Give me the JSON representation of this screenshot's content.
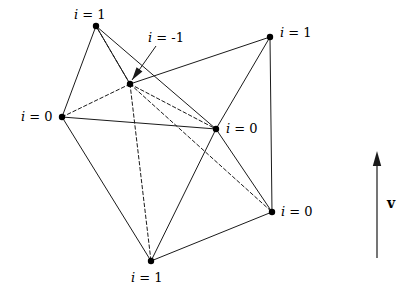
{
  "figure": {
    "type": "diagram",
    "background_color": "#ffffff",
    "stroke_color": "#1a1a1a",
    "vertex_color": "#000000",
    "vertex_radius": 3.2,
    "solid_stroke_width": 1.0,
    "dashed_stroke_width": 1.0,
    "dash_pattern": "3.5,2.5",
    "vertices": [
      {
        "id": "tl",
        "name": "top-left-vertex",
        "x": 96,
        "y": 26,
        "label": "i = 1",
        "label_x": 74,
        "label_y": 8,
        "label_align": "left"
      },
      {
        "id": "tr",
        "name": "top-right-vertex",
        "x": 270,
        "y": 37,
        "label": "i = 1",
        "label_x": 280,
        "label_y": 26,
        "label_align": "left"
      },
      {
        "id": "lf",
        "name": "left-vertex",
        "x": 62,
        "y": 117,
        "label": "i = 0",
        "label_x": 21,
        "label_y": 110,
        "label_align": "left"
      },
      {
        "id": "cr",
        "name": "center-right-vertex",
        "x": 216,
        "y": 129,
        "label": "i = 0",
        "label_x": 226,
        "label_y": 122,
        "label_align": "left"
      },
      {
        "id": "br",
        "name": "bottom-right-vertex",
        "x": 272,
        "y": 212,
        "label": "i = 0",
        "label_x": 281,
        "label_y": 205,
        "label_align": "left"
      },
      {
        "id": "bt",
        "name": "bottom-vertex",
        "x": 151,
        "y": 261,
        "label": "i = 1",
        "label_x": 131,
        "label_y": 271,
        "label_align": "left"
      },
      {
        "id": "in",
        "name": "interior-vertex",
        "x": 130,
        "y": 84,
        "label": "i = -1",
        "label_x": 148,
        "label_y": 31,
        "label_align": "left"
      }
    ],
    "solid_edges": [
      {
        "name": "edge-tl-lf",
        "from": "tl",
        "to": "lf"
      },
      {
        "name": "edge-tl-in",
        "from": "tl",
        "to": "in"
      },
      {
        "name": "edge-tl-cr",
        "from": "tl",
        "to": "cr"
      },
      {
        "name": "edge-tr-in",
        "from": "tr",
        "to": "in"
      },
      {
        "name": "edge-tr-cr",
        "from": "tr",
        "to": "cr"
      },
      {
        "name": "edge-tr-br",
        "from": "tr",
        "to": "br"
      },
      {
        "name": "edge-lf-cr",
        "from": "lf",
        "to": "cr"
      },
      {
        "name": "edge-lf-bt",
        "from": "lf",
        "to": "bt"
      },
      {
        "name": "edge-cr-br",
        "from": "cr",
        "to": "br"
      },
      {
        "name": "edge-cr-bt",
        "from": "cr",
        "to": "bt"
      },
      {
        "name": "edge-br-bt",
        "from": "br",
        "to": "bt"
      }
    ],
    "dashed_edges": [
      {
        "name": "dashed-edge-in-lf",
        "from": "in",
        "to": "lf"
      },
      {
        "name": "dashed-edge-in-tl",
        "from": "in",
        "to": "tl"
      },
      {
        "name": "dashed-edge-in-cr",
        "from": "in",
        "to": "cr"
      },
      {
        "name": "dashed-edge-in-br",
        "from": "in",
        "to": "br"
      },
      {
        "name": "dashed-edge-in-bt",
        "from": "in",
        "to": "bt"
      }
    ],
    "pointer_arrow": {
      "name": "interior-vertex-pointer-arrow",
      "x1": 156,
      "y1": 46,
      "x2": 132,
      "y2": 80
    },
    "direction_arrow": {
      "name": "direction-arrow",
      "x": 377,
      "y_tail": 258,
      "y_tip": 151,
      "label": "v",
      "label_x": 387,
      "label_y": 196
    }
  }
}
